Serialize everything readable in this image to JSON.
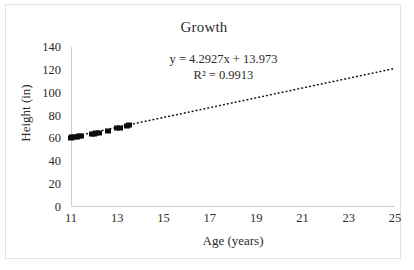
{
  "chart_data": {
    "type": "scatter",
    "title": "Growth",
    "xlabel": "Age (years)",
    "ylabel": "Height (in)",
    "xlim": [
      11,
      25
    ],
    "ylim": [
      0,
      140
    ],
    "xticks": [
      11,
      13,
      15,
      17,
      19,
      21,
      23,
      25
    ],
    "yticks": [
      0,
      20,
      40,
      60,
      80,
      100,
      120,
      140
    ],
    "grid": false,
    "legend": "none",
    "marker_style": "filled-square",
    "marker_color": "#0d0d0d",
    "trendline": {
      "style": "dotted",
      "color": "#1a1a1a",
      "slope": 4.2927,
      "intercept": 13.973,
      "x_start": 11,
      "x_end": 25,
      "equation": "y = 4.2927x + 13.973",
      "r_squared_label": "R² = 0.9913",
      "r_squared": 0.9913
    },
    "points": [
      {
        "x": 11.0,
        "y": 60.5
      },
      {
        "x": 11.05,
        "y": 60.9
      },
      {
        "x": 11.15,
        "y": 61.3
      },
      {
        "x": 11.25,
        "y": 61.6
      },
      {
        "x": 11.35,
        "y": 62.0
      },
      {
        "x": 11.45,
        "y": 62.3
      },
      {
        "x": 11.9,
        "y": 63.6
      },
      {
        "x": 12.0,
        "y": 64.0
      },
      {
        "x": 12.1,
        "y": 64.4
      },
      {
        "x": 12.2,
        "y": 64.8
      },
      {
        "x": 12.6,
        "y": 66.5
      },
      {
        "x": 13.0,
        "y": 68.8
      },
      {
        "x": 13.1,
        "y": 69.2
      },
      {
        "x": 13.4,
        "y": 70.9
      },
      {
        "x": 13.5,
        "y": 71.5
      }
    ]
  },
  "annotations": {
    "equation_line1": "y = 4.2927x + 13.973",
    "equation_line2": "R² = 0.9913"
  },
  "axes": {
    "y_tick_labels": [
      "140",
      "120",
      "100",
      "80",
      "60",
      "40",
      "20",
      "0"
    ],
    "x_tick_labels": [
      "11",
      "13",
      "15",
      "17",
      "19",
      "21",
      "23",
      "25"
    ]
  }
}
